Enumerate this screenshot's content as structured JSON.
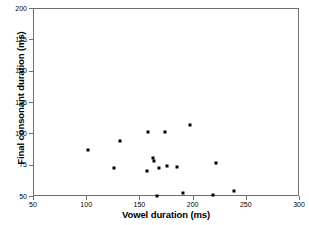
{
  "chart_data": {
    "type": "scatter",
    "title": "",
    "xlabel": "Vowel duration (ms)",
    "ylabel": "Final consonant duration (ms)",
    "xlim": [
      50,
      300
    ],
    "ylim": [
      50,
      200
    ],
    "xticks": [
      50,
      100,
      150,
      200,
      250,
      300
    ],
    "yticks": [
      50,
      75,
      100,
      125,
      150,
      175,
      200
    ],
    "xtick_labels": [
      "50",
      "100",
      "150",
      "200",
      "250",
      "300"
    ],
    "ytick_labels": [
      "50",
      "75",
      "100",
      "125",
      "150",
      "175",
      "200"
    ],
    "grid": false,
    "legend": null,
    "marker": "square",
    "marker_color": "#000000",
    "frame_color": "#6f6f6f",
    "series": [
      {
        "name": "observations",
        "points": [
          {
            "x": 102,
            "y": 87
          },
          {
            "x": 126,
            "y": 72
          },
          {
            "x": 132,
            "y": 94
          },
          {
            "x": 157,
            "y": 70
          },
          {
            "x": 158,
            "y": 101
          },
          {
            "x": 163,
            "y": 80
          },
          {
            "x": 164,
            "y": 78
          },
          {
            "x": 167,
            "y": 50
          },
          {
            "x": 168,
            "y": 72
          },
          {
            "x": 174,
            "y": 101
          },
          {
            "x": 176,
            "y": 74
          },
          {
            "x": 185,
            "y": 73
          },
          {
            "x": 191,
            "y": 52
          },
          {
            "x": 198,
            "y": 107
          },
          {
            "x": 219,
            "y": 51
          },
          {
            "x": 222,
            "y": 76
          },
          {
            "x": 239,
            "y": 54
          }
        ]
      }
    ]
  }
}
